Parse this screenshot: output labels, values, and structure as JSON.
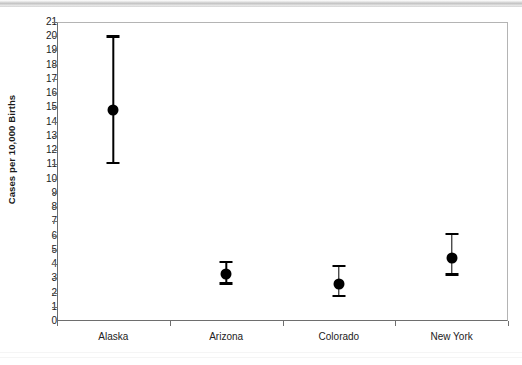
{
  "figure": {
    "background_color": "#ffffff",
    "marker_color": "#000000",
    "axis_color": "#6e6e6e",
    "frame_color": "#b4b4b4"
  },
  "chart_data": {
    "type": "scatter",
    "title": "",
    "subtitle": "",
    "xlabel": "",
    "ylabel": "Cases per 10,000 Births",
    "categories": [
      "Alaska",
      "Arizona",
      "Colorado",
      "New York"
    ],
    "values": [
      14.8,
      3.3,
      2.6,
      4.4
    ],
    "error_low": [
      11.1,
      2.65,
      1.75,
      3.25
    ],
    "error_high": [
      20.0,
      4.15,
      3.85,
      6.1
    ],
    "series": [
      {
        "name": "Rate with 95% interval",
        "values": [
          14.8,
          3.3,
          2.6,
          4.4
        ],
        "error_low": [
          11.1,
          2.65,
          1.75,
          3.25
        ],
        "error_high": [
          20.0,
          4.15,
          3.85,
          6.1
        ]
      }
    ],
    "ylim": [
      0,
      21
    ],
    "ytick_labels": [
      "21",
      "20",
      "19",
      "18",
      "17",
      "16",
      "15",
      "14",
      "13",
      "12",
      "11",
      "10",
      "9",
      "8",
      "7",
      "6",
      "5",
      "4",
      "3",
      "2",
      "1",
      "0"
    ],
    "ytick_values": [
      21,
      20,
      19,
      18,
      17,
      16,
      15,
      14,
      13,
      12,
      11,
      10,
      9,
      8,
      7,
      6,
      5,
      4,
      3,
      2,
      1,
      0
    ],
    "ytick_step": 1,
    "grid": false,
    "legend": false,
    "legend_position": "none",
    "marker_style": "filled-circle",
    "errorbar_style": "capped"
  }
}
